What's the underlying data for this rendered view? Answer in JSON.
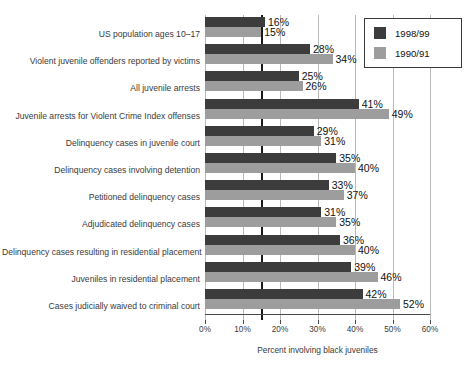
{
  "chart_data": {
    "type": "bar",
    "orientation": "horizontal",
    "title": "",
    "xlabel": "Percent involving black juveniles",
    "ylabel": "",
    "xlim": [
      0,
      60
    ],
    "xticks": [
      "0%",
      "10%",
      "20%",
      "30%",
      "40%",
      "50%",
      "60%"
    ],
    "xtickvalues": [
      0,
      10,
      20,
      30,
      40,
      50,
      60
    ],
    "grid": true,
    "legend_position": "top-right",
    "reference_line": {
      "value": 15,
      "label": "US population ages 10-17 baseline",
      "color": "#1a1a1a"
    },
    "categories": [
      "US population ages 10–17",
      "Violent juvenile offenders reported by victims",
      "All juvenile arrests",
      "Juvenile arrests for Violent Crime Index offenses",
      "Delinquency cases in juvenile court",
      "Delinquency cases involving detention",
      "Petitioned delinquency cases",
      "Adjudicated delinquency cases",
      "Delinquency cases resulting in residential placement",
      "Juveniles in residential placement",
      "Cases judicially waived to criminal court"
    ],
    "series": [
      {
        "name": "1998/99",
        "color": "#3c3c3c",
        "values": [
          16,
          28,
          25,
          41,
          29,
          35,
          33,
          31,
          36,
          39,
          42
        ],
        "labels": [
          "16%",
          "28%",
          "25%",
          "41%",
          "29%",
          "35%",
          "33%",
          "31%",
          "36%",
          "39%",
          "42%"
        ]
      },
      {
        "name": "1990/91",
        "color": "#9d9d9d",
        "values": [
          15,
          34,
          26,
          49,
          31,
          40,
          37,
          35,
          40,
          46,
          52
        ],
        "labels": [
          "15%",
          "34%",
          "26%",
          "49%",
          "31%",
          "40%",
          "37%",
          "35%",
          "40%",
          "46%",
          "52%"
        ]
      }
    ]
  },
  "legend": {
    "items": [
      {
        "label": "1998/99",
        "color": "#3c3c3c"
      },
      {
        "label": "1990/91",
        "color": "#9d9d9d"
      }
    ]
  }
}
